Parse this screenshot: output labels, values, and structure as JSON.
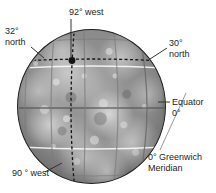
{
  "figure": {
    "background_color": "#ffffff",
    "globe_outline_color": "#1d1d1d"
  },
  "labels": {
    "longitude_92_west": "92° west",
    "latitude_32_north_line1": "32°",
    "latitude_32_north_line2": "north",
    "latitude_30_north_line1": "30°",
    "latitude_30_north_line2": "north",
    "equator_line1": "Equator",
    "equator_line2": "0°",
    "greenwich_line1": "0° Greenwich",
    "greenwich_line2": "Meridian",
    "longitude_90_west": "90 ° west"
  },
  "diagram": {
    "marker_point": {
      "name": "location-marker",
      "latitude": "32° north",
      "longitude": "92° west"
    },
    "latitude_lines": [
      {
        "name": "30-north",
        "style": "solid-white"
      },
      {
        "name": "equator-0",
        "style": "solid-gray"
      },
      {
        "name": "30-south",
        "style": "solid-white"
      }
    ],
    "dashed_lines": [
      {
        "name": "32-north-dashed",
        "orientation": "horizontal"
      },
      {
        "name": "92-west-dashed",
        "orientation": "vertical"
      }
    ],
    "meridians": [
      {
        "name": "greenwich-meridian-0"
      },
      {
        "name": "meridian-west-1"
      },
      {
        "name": "meridian-west-2"
      },
      {
        "name": "meridian-west-3"
      },
      {
        "name": "meridian-west-4"
      }
    ]
  }
}
